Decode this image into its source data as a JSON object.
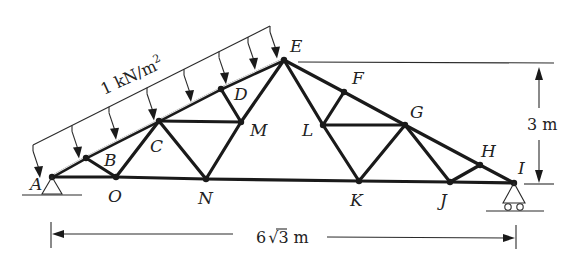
{
  "figure": {
    "type": "truss",
    "load_label": "1 kN/m²",
    "load_label_parts": {
      "value": "1 kN/m",
      "exp": "2"
    },
    "height_dim_label": "3 m",
    "span_dim_label_parts": {
      "coef": "6",
      "radical": "3",
      "unit": "m"
    },
    "span_dim_label": "6√3 m",
    "colors": {
      "ink": "#1a1a1a",
      "background": "#ffffff"
    }
  },
  "nodes": [
    {
      "id": "A",
      "x": 52,
      "y": 177,
      "lx": 30,
      "ly": 190
    },
    {
      "id": "B",
      "x": 86,
      "y": 158,
      "lx": 104,
      "ly": 166
    },
    {
      "id": "C",
      "x": 159,
      "y": 121,
      "lx": 150,
      "ly": 152
    },
    {
      "id": "D",
      "x": 221,
      "y": 89,
      "lx": 234,
      "ly": 100
    },
    {
      "id": "E",
      "x": 284,
      "y": 60,
      "lx": 290,
      "ly": 52
    },
    {
      "id": "F",
      "x": 344,
      "y": 92,
      "lx": 352,
      "ly": 84
    },
    {
      "id": "G",
      "x": 405,
      "y": 125,
      "lx": 410,
      "ly": 118
    },
    {
      "id": "H",
      "x": 480,
      "y": 165,
      "lx": 481,
      "ly": 157
    },
    {
      "id": "I",
      "x": 514,
      "y": 183,
      "lx": 518,
      "ly": 174
    },
    {
      "id": "J",
      "x": 450,
      "y": 182,
      "lx": 440,
      "ly": 206
    },
    {
      "id": "K",
      "x": 359,
      "y": 181,
      "lx": 350,
      "ly": 206
    },
    {
      "id": "L",
      "x": 323,
      "y": 125,
      "lx": 302,
      "ly": 136
    },
    {
      "id": "M",
      "x": 241,
      "y": 122,
      "lx": 250,
      "ly": 136
    },
    {
      "id": "N",
      "x": 206,
      "y": 179,
      "lx": 198,
      "ly": 204
    },
    {
      "id": "O",
      "x": 116,
      "y": 177,
      "lx": 108,
      "ly": 202
    }
  ],
  "members": [
    [
      "A",
      "O"
    ],
    [
      "O",
      "N"
    ],
    [
      "N",
      "K"
    ],
    [
      "K",
      "J"
    ],
    [
      "J",
      "I"
    ],
    [
      "B",
      "O"
    ],
    [
      "O",
      "C"
    ],
    [
      "C",
      "N"
    ],
    [
      "C",
      "M"
    ],
    [
      "D",
      "M"
    ],
    [
      "M",
      "N"
    ],
    [
      "M",
      "E"
    ],
    [
      "E",
      "L"
    ],
    [
      "F",
      "L"
    ],
    [
      "L",
      "G"
    ],
    [
      "L",
      "K"
    ],
    [
      "K",
      "G"
    ],
    [
      "G",
      "J"
    ],
    [
      "J",
      "H"
    ],
    [
      "E",
      "F"
    ],
    [
      "F",
      "G"
    ],
    [
      "G",
      "H"
    ],
    [
      "H",
      "I"
    ]
  ],
  "top_chord_left": [
    "A",
    "B",
    "C",
    "D",
    "E"
  ],
  "load": {
    "line_start": [
      33,
      145
    ],
    "line_end": [
      270,
      26
    ],
    "arrow_x": [
      33,
      72,
      109,
      147,
      184,
      219,
      248,
      270
    ]
  }
}
